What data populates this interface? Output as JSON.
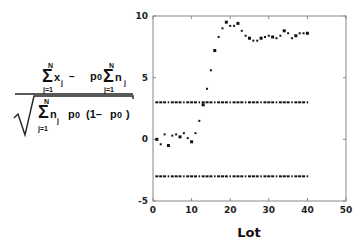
{
  "ylabel_formula": {
    "numerator": {
      "sum1_top": "N",
      "sum1_bottom": "j=1",
      "sum1_term": "x",
      "sum1_sub": "j",
      "minus": "–",
      "p0": "p",
      "p0_sub": "0",
      "sum2_top": "N",
      "sum2_bottom": "j=1",
      "sum2_term": "n",
      "sum2_sub": "j"
    },
    "denominator": {
      "sum_top": "N",
      "sum_bottom": "j=1",
      "sum_term": "n",
      "sum_sub": "j",
      "p0": "p",
      "p0_sub": "0",
      "paren_open": "(1–",
      "p0b": "p",
      "p0b_sub": "0",
      "paren_close": ")"
    },
    "sigma": "Σ"
  },
  "chart_data": {
    "type": "scatter",
    "title": "",
    "xlabel": "Lot",
    "ylabel": "(Σx_j − p0 Σn_j) / sqrt(Σn_j p0 (1 − p0))",
    "xlim": [
      0,
      50
    ],
    "ylim": [
      -5,
      10
    ],
    "xticks": [
      0,
      10,
      20,
      30,
      40,
      50
    ],
    "yticks": [
      -5,
      0,
      5,
      10
    ],
    "xtick_labels": [
      "0",
      "10",
      "20",
      "30",
      "40",
      "50"
    ],
    "ytick_labels": [
      "-5",
      "0",
      "5",
      "10"
    ],
    "grid": false,
    "legend": null,
    "series": [
      {
        "name": "Cumulative standardized statistic",
        "marker": "square",
        "x": [
          1,
          2,
          3,
          4,
          5,
          6,
          7,
          8,
          9,
          10,
          11,
          12,
          13,
          14,
          15,
          16,
          17,
          18,
          19,
          20,
          21,
          22,
          23,
          24,
          25,
          26,
          27,
          28,
          29,
          30,
          31,
          32,
          33,
          34,
          35,
          36,
          37,
          38,
          39,
          40
        ],
        "y": [
          0.0,
          -0.4,
          0.4,
          -0.5,
          0.3,
          0.4,
          0.2,
          0.5,
          0.1,
          -0.2,
          0.5,
          1.5,
          2.8,
          4.1,
          5.6,
          7.2,
          8.3,
          9.0,
          9.5,
          9.2,
          9.2,
          9.4,
          8.8,
          8.4,
          8.2,
          8.0,
          8.0,
          8.2,
          8.3,
          8.4,
          8.3,
          8.2,
          8.4,
          8.8,
          8.6,
          8.2,
          8.4,
          8.6,
          8.6,
          8.6
        ]
      },
      {
        "name": "Upper control limit",
        "marker": "dash",
        "x": [
          1,
          2,
          3,
          4,
          5,
          6,
          7,
          8,
          9,
          10,
          11,
          12,
          13,
          14,
          15,
          16,
          17,
          18,
          19,
          20,
          21,
          22,
          23,
          24,
          25,
          26,
          27,
          28,
          29,
          30,
          31,
          32,
          33,
          34,
          35,
          36,
          37,
          38,
          39,
          40
        ],
        "y": [
          3,
          3,
          3,
          3,
          3,
          3,
          3,
          3,
          3,
          3,
          3,
          3,
          3,
          3,
          3,
          3,
          3,
          3,
          3,
          3,
          3,
          3,
          3,
          3,
          3,
          3,
          3,
          3,
          3,
          3,
          3,
          3,
          3,
          3,
          3,
          3,
          3,
          3,
          3,
          3
        ]
      },
      {
        "name": "Lower control limit",
        "marker": "dash",
        "x": [
          1,
          2,
          3,
          4,
          5,
          6,
          7,
          8,
          9,
          10,
          11,
          12,
          13,
          14,
          15,
          16,
          17,
          18,
          19,
          20,
          21,
          22,
          23,
          24,
          25,
          26,
          27,
          28,
          29,
          30,
          31,
          32,
          33,
          34,
          35,
          36,
          37,
          38,
          39,
          40
        ],
        "y": [
          -3,
          -3,
          -3,
          -3,
          -3,
          -3,
          -3,
          -3,
          -3,
          -3,
          -3,
          -3,
          -3,
          -3,
          -3,
          -3,
          -3,
          -3,
          -3,
          -3,
          -3,
          -3,
          -3,
          -3,
          -3,
          -3,
          -3,
          -3,
          -3,
          -3,
          -3,
          -3,
          -3,
          -3,
          -3,
          -3,
          -3,
          -3,
          -3,
          -3
        ]
      }
    ],
    "colors": {
      "marker": "#111111",
      "axis": "#888888",
      "text": "#222222"
    }
  }
}
